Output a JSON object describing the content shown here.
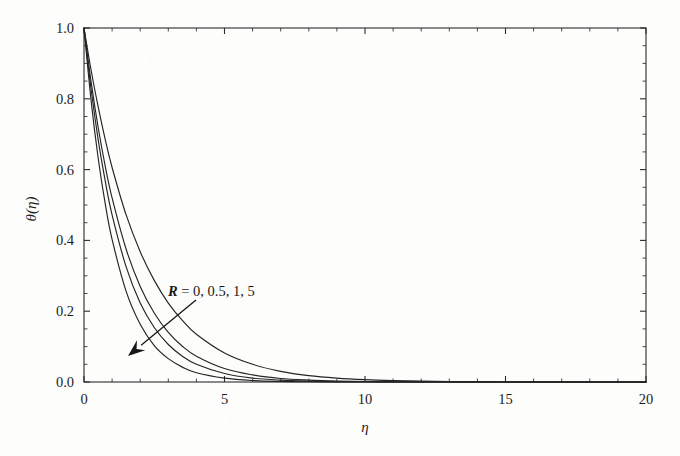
{
  "figure": {
    "background_color": "#fdfdfc",
    "ink_color": "#242424",
    "frame": {
      "left": 84,
      "top": 28,
      "right": 646,
      "bottom": 382
    }
  },
  "annotation": {
    "symbol": "R",
    "equals": " = ",
    "values_text": "0, 0.5, 1, 5",
    "full_text": "R = 0, 0.5, 1, 5",
    "arrow_from": [
      196,
      300
    ],
    "arrow_to": [
      128,
      356
    ],
    "arrow_meaning": "increasing-R"
  },
  "chart_data": {
    "type": "line",
    "title": "",
    "xlabel": "η",
    "ylabel": "θ(η)",
    "xlim": [
      0,
      20
    ],
    "ylim": [
      0,
      1
    ],
    "grid": false,
    "legend_position": "none",
    "xticks": [
      0,
      5,
      10,
      15,
      20
    ],
    "xtick_labels": [
      "0",
      "5",
      "10",
      "15",
      "20"
    ],
    "xtick_minor_step": 1,
    "yticks": [
      0.0,
      0.2,
      0.4,
      0.6,
      0.8,
      1.0
    ],
    "ytick_labels": [
      "0.0",
      "0.2",
      "0.4",
      "0.6",
      "0.8",
      "1.0"
    ],
    "ytick_minor_step": 0.05,
    "parameter_name": "R",
    "parameter_values": [
      0,
      0.5,
      1,
      5
    ],
    "x": [
      0,
      0.25,
      0.5,
      0.75,
      1,
      1.5,
      2,
      2.5,
      3,
      3.5,
      4,
      5,
      6,
      7,
      8,
      9,
      10,
      11,
      12,
      13,
      14,
      15,
      16,
      17,
      18,
      19,
      20
    ],
    "series": [
      {
        "name": "R = 0",
        "values": [
          1.0,
          0.797,
          0.635,
          0.506,
          0.403,
          0.256,
          0.163,
          0.103,
          0.066,
          0.042,
          0.026,
          0.011,
          0.0043,
          0.0017,
          0.0007,
          0.0003,
          0.0001,
          0.0,
          0.0,
          0.0,
          0.0,
          0.0,
          0.0,
          0.0,
          0.0,
          0.0,
          0.0
        ]
      },
      {
        "name": "R = 0.5",
        "values": [
          1.0,
          0.829,
          0.687,
          0.57,
          0.472,
          0.325,
          0.223,
          0.154,
          0.106,
          0.073,
          0.05,
          0.024,
          0.011,
          0.0053,
          0.0025,
          0.0012,
          0.0006,
          0.0003,
          0.0001,
          0.0001,
          0.0,
          0.0,
          0.0,
          0.0,
          0.0,
          0.0,
          0.0
        ]
      },
      {
        "name": "R = 1",
        "values": [
          1.0,
          0.849,
          0.721,
          0.612,
          0.52,
          0.375,
          0.27,
          0.195,
          0.14,
          0.101,
          0.073,
          0.038,
          0.02,
          0.01,
          0.0054,
          0.0028,
          0.0015,
          0.0008,
          0.0004,
          0.0002,
          0.0001,
          0.0001,
          0.0,
          0.0,
          0.0,
          0.0,
          0.0
        ]
      },
      {
        "name": "R = 5",
        "values": [
          1.0,
          0.882,
          0.779,
          0.687,
          0.606,
          0.472,
          0.368,
          0.287,
          0.223,
          0.174,
          0.135,
          0.082,
          0.05,
          0.03,
          0.018,
          0.011,
          0.0067,
          0.0041,
          0.0025,
          0.0015,
          0.0009,
          0.0006,
          0.0003,
          0.0002,
          0.0001,
          0.0001,
          0.0
        ]
      }
    ]
  }
}
